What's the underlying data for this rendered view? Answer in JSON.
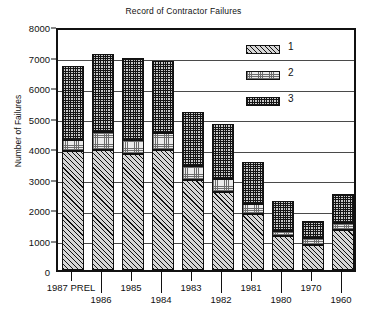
{
  "chart_data": {
    "type": "bar",
    "subtype": "stacked-bar",
    "title": "Record of Contractor Failures",
    "xlabel": "",
    "ylabel": "Number of Failures",
    "ylim": [
      0,
      8000
    ],
    "ytick_labels": [
      "8000",
      "7000",
      "6000",
      "5000",
      "4000",
      "3000",
      "2000",
      "1000",
      "0"
    ],
    "ytick_values": [
      8000,
      7000,
      6000,
      5000,
      4000,
      3000,
      2000,
      1000,
      0
    ],
    "grid": true,
    "legend_position": "upper right",
    "categories": [
      "1987 PREL",
      "1986",
      "1985",
      "1984",
      "1983",
      "1982",
      "1981",
      "1980",
      "1970",
      "1960"
    ],
    "xtick_labels_row1": [
      "1987 PREL",
      "",
      "1985",
      "",
      "1983",
      "",
      "1981",
      "",
      "1970",
      ""
    ],
    "xtick_labels_row2": [
      "",
      "1986",
      "",
      "1984",
      "",
      "1982",
      "",
      "1980",
      "",
      "1960"
    ],
    "series": [
      {
        "name": "1",
        "values": [
          3900,
          3950,
          3800,
          3920,
          2950,
          2550,
          1850,
          1100,
          820,
          1320
        ]
      },
      {
        "name": "2",
        "values": [
          350,
          570,
          450,
          570,
          470,
          450,
          300,
          180,
          230,
          220
        ]
      },
      {
        "name": "3",
        "values": [
          2430,
          2550,
          2700,
          2370,
          1750,
          1800,
          1380,
          990,
          560,
          960
        ]
      }
    ],
    "totals": [
      6680,
      7070,
      6950,
      6860,
      5170,
      4800,
      3530,
      2270,
      1610,
      2500
    ],
    "legend": [
      {
        "label": "1",
        "pattern": "diagonal-hatch"
      },
      {
        "label": "2",
        "pattern": "light-stipple"
      },
      {
        "label": "3",
        "pattern": "dense-dots"
      }
    ],
    "colors": {
      "ink": "#111111",
      "grid": "#4a4a4a",
      "background": "#ffffff"
    }
  }
}
